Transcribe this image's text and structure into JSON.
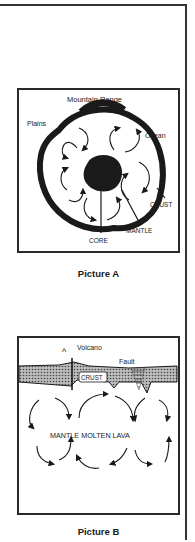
{
  "picture_a": {
    "caption": "Picture A",
    "labels": {
      "mountain_range": "Mountain Range",
      "plains": "Plains",
      "ocean": "Ocean",
      "crust": "CRUST",
      "core": "CORE",
      "mantle": "MANTLE"
    }
  },
  "picture_b": {
    "caption": "Picture B",
    "labels": {
      "volcano_symbol": "^",
      "volcano": "Volcano",
      "fault": "Fault",
      "crust": "CRUST",
      "mantle": "MANTLE MOLTEN LAVA"
    }
  },
  "colors": {
    "ink": "#1a1a1a",
    "frame": "#333333",
    "background": "#ffffff"
  }
}
